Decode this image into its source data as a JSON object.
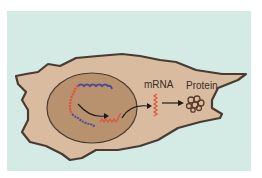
{
  "diagram": {
    "labels": {
      "mrna": "mRNA",
      "protein": "Protein"
    },
    "colors": {
      "background": "#d3ebe4",
      "cytoplasm": "#d9bca0",
      "nucleus": "#b8916e",
      "outline": "#4a3b32",
      "dna_red": "#e0523a",
      "dna_blue": "#4a4a9a",
      "mrna": "#e0523a",
      "protein": "#5a3e2c",
      "arrow": "#1e1a18"
    },
    "components": [
      "cell",
      "nucleus",
      "DNA",
      "mRNA",
      "protein",
      "arrows"
    ]
  }
}
